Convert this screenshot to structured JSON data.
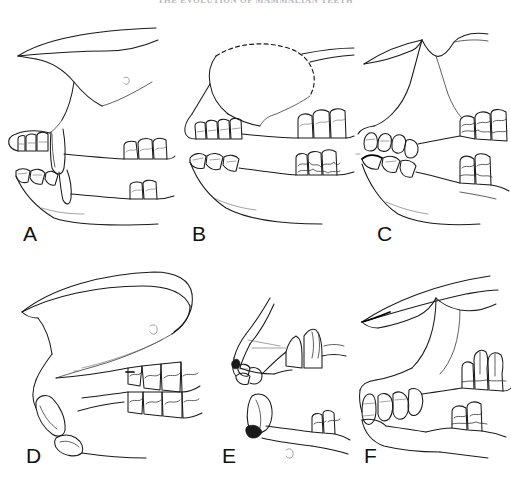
{
  "page": {
    "width": 511,
    "height": 490,
    "background_color": "#ffffff",
    "ink_color": "#1a1a1a"
  },
  "running_head": {
    "text": "THE EVOLUTION OF MAMMALIAN TEETH",
    "color": "#b8b8bd",
    "visible": "partially cropped at top edge"
  },
  "figure": {
    "type": "line-drawing-plate",
    "rows": 2,
    "columns": 3,
    "panel_count": 6,
    "panels": [
      {
        "label": "A",
        "row": 1,
        "column": 1,
        "description": "Lateral view of upper and lower jaw with incisors, large canine and cheek teeth separated by a diastema",
        "features": [
          "incisors",
          "canine",
          "diastema",
          "premolars",
          "molars",
          "mandibular ramus",
          "zygomatic arch"
        ],
        "dashed_reconstruction": "false"
      },
      {
        "label": "B",
        "row": 1,
        "column": 2,
        "description": "Lateral view of jaws with dashed reconstructed cranial outline above, four incisors and cheek tooth rows",
        "features": [
          "incisors",
          "canine",
          "diastema",
          "cheek teeth",
          "reconstructed skull roof"
        ],
        "dashed_reconstruction": "true"
      },
      {
        "label": "C",
        "row": 1,
        "column": 3,
        "description": "Lateral view of skull with notched dorsal profile, procumbent incisors and crowded cheek teeth",
        "features": [
          "notched nasal profile",
          "procumbent incisors",
          "cheek teeth",
          "mandible"
        ],
        "dashed_reconstruction": "false"
      },
      {
        "label": "D",
        "row": 2,
        "column": 1,
        "description": "Rodent-like skull with long curved ever-growing incisor, very long diastema and posterior molar row",
        "features": [
          "enlarged curved incisor",
          "long diastema",
          "molar row",
          "elongate rostrum"
        ],
        "dashed_reconstruction": "false"
      },
      {
        "label": "E",
        "row": 2,
        "column": 2,
        "description": "Small compact jaw with shaded enamel bands on incisors and widely spaced cheek teeth",
        "features": [
          "shaded incisor enamel",
          "reduced dentition",
          "short diastema",
          "cheek teeth"
        ],
        "dashed_reconstruction": "false"
      },
      {
        "label": "F",
        "row": 2,
        "column": 3,
        "description": "Lateral view with slender rostrum, row of simple anterior teeth and tall posterior molars",
        "features": [
          "slender rostrum",
          "anterior tooth row",
          "tall molars",
          "mandible"
        ],
        "dashed_reconstruction": "false"
      }
    ]
  },
  "labels": {
    "a": "A",
    "b": "B",
    "c": "C",
    "d": "D",
    "e": "E",
    "f": "F"
  }
}
